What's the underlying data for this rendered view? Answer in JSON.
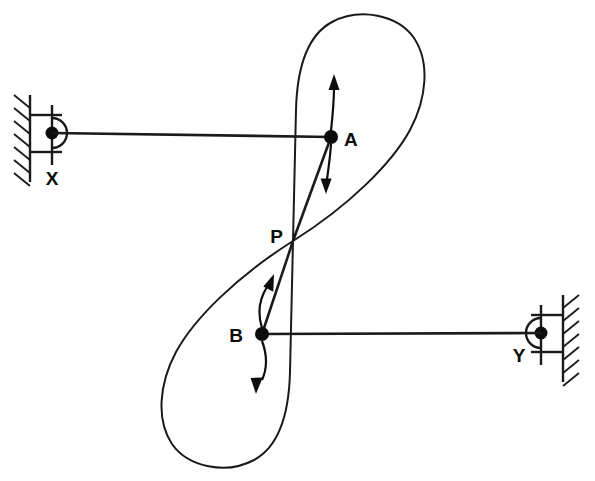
{
  "figure": {
    "type": "mechanism-diagram",
    "canvas": {
      "width": 595,
      "height": 481
    },
    "colors": {
      "stroke": "#1a1a1a",
      "joint": "#0d0d0d",
      "background": "#ffffff"
    }
  },
  "labels": {
    "ground_pivot_left": "X",
    "ground_pivot_right": "Y",
    "coupler_point_upper": "A",
    "coupler_point_lower": "B",
    "crossing_point": "P"
  },
  "points": {
    "X": {
      "x": 52,
      "y": 133
    },
    "Y": {
      "x": 541,
      "y": 333
    },
    "A": {
      "x": 331,
      "y": 137
    },
    "B": {
      "x": 262,
      "y": 334
    },
    "P": {
      "x": 293,
      "y": 241
    }
  },
  "label_positions": {
    "X": {
      "x": 52,
      "y": 180
    },
    "Y": {
      "x": 519,
      "y": 355
    },
    "A": {
      "x": 348,
      "y": 141
    },
    "B": {
      "x": 245,
      "y": 336
    },
    "P": {
      "x": 280,
      "y": 238
    }
  },
  "links": [
    {
      "name": "link-X-A",
      "from": "X",
      "to": "A"
    },
    {
      "name": "link-B-Y",
      "from": "B",
      "to": "Y"
    },
    {
      "name": "link-P-A",
      "from": "P",
      "to": "A"
    },
    {
      "name": "link-P-B",
      "from": "P",
      "to": "B"
    }
  ],
  "motion_arrows": [
    {
      "name": "motion-arrow-A",
      "at": "A",
      "direction": "double-headed-vertical",
      "top": {
        "x": 333,
        "y": 78
      },
      "bottom": {
        "x": 326,
        "y": 189
      }
    },
    {
      "name": "motion-arrow-B",
      "at": "B",
      "direction": "double-headed-vertical-curved",
      "top": {
        "x": 268,
        "y": 277
      },
      "bottom": {
        "x": 265,
        "y": 390
      }
    }
  ],
  "supports": [
    {
      "name": "ground-support-X",
      "side": "left",
      "wall_x": 30,
      "wall_top": 95,
      "wall_bottom": 178,
      "hatch_count": 7
    },
    {
      "name": "ground-support-Y",
      "side": "right",
      "wall_x": 563,
      "wall_top": 295,
      "wall_bottom": 378,
      "hatch_count": 7
    }
  ],
  "coupler_curve": {
    "name": "figure-eight-coupler-curve",
    "shape": "lemniscate / figure-eight",
    "crossing_at": "P",
    "upper_lobe": {
      "top_y": 17,
      "right_x": 427,
      "left_x": 294
    },
    "lower_lobe": {
      "bottom_y": 447,
      "left_x": 177,
      "right_x": 306
    }
  }
}
